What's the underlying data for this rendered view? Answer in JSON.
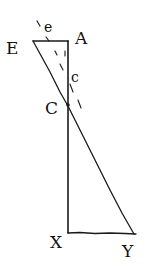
{
  "diagram": {
    "type": "geometric-construction",
    "colors": {
      "ink": "#1a1a1a",
      "background": "#ffffff"
    },
    "labels": {
      "E": "E",
      "A": "A",
      "e": "e",
      "c": "c",
      "C": "C",
      "X": "X",
      "Y": "Y"
    },
    "points": {
      "E": [
        33,
        41
      ],
      "A": [
        68,
        41
      ],
      "C": [
        68,
        106
      ],
      "X": [
        68,
        233
      ],
      "Y": [
        134,
        234
      ]
    },
    "segments": [
      [
        "E",
        "A"
      ],
      [
        "A",
        "X"
      ],
      [
        "E",
        "Y"
      ],
      [
        "X",
        "Y"
      ]
    ]
  }
}
